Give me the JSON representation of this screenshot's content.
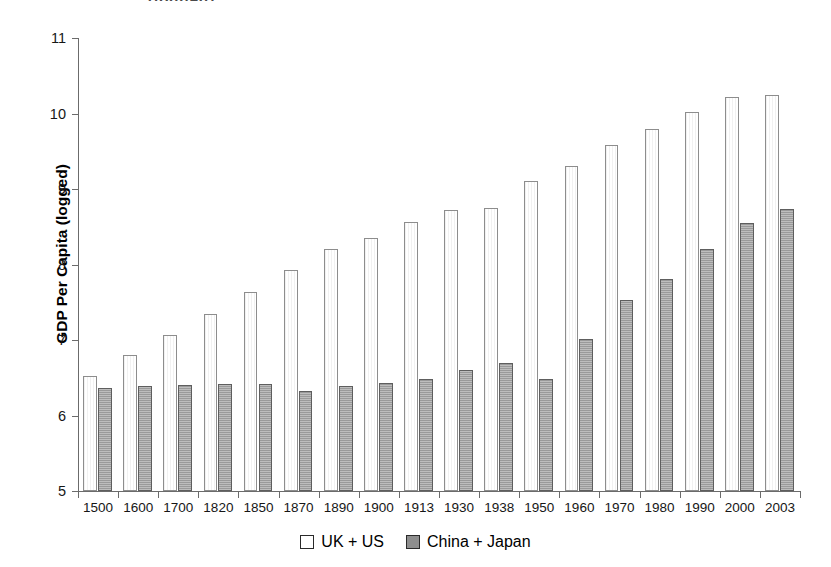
{
  "top_artifact": "(logged)",
  "chart_data": {
    "type": "bar",
    "title": "",
    "xlabel": "",
    "ylabel": "GDP Per Capita (logged)",
    "ylim": [
      5,
      11
    ],
    "yticks": [
      5,
      6,
      7,
      8,
      9,
      10,
      11
    ],
    "grid": false,
    "legend_position": "bottom-center",
    "categories": [
      "1500",
      "1600",
      "1700",
      "1820",
      "1850",
      "1870",
      "1890",
      "1900",
      "1913",
      "1930",
      "1938",
      "1950",
      "1960",
      "1970",
      "1980",
      "1990",
      "2000",
      "2003"
    ],
    "series": [
      {
        "name": "UK + US",
        "style": "light",
        "values": [
          6.52,
          6.8,
          7.06,
          7.35,
          7.63,
          7.93,
          8.2,
          8.35,
          8.56,
          8.72,
          8.75,
          9.11,
          9.3,
          9.58,
          9.8,
          10.02,
          10.22,
          10.25
        ]
      },
      {
        "name": "China + Japan",
        "style": "dark",
        "values": [
          6.37,
          6.39,
          6.4,
          6.42,
          6.42,
          6.32,
          6.39,
          6.43,
          6.48,
          6.6,
          6.7,
          6.48,
          7.02,
          7.53,
          7.81,
          8.21,
          8.55,
          8.73
        ]
      }
    ]
  },
  "legend": {
    "items": [
      {
        "label": "UK + US",
        "style": "light"
      },
      {
        "label": "China + Japan",
        "style": "dark"
      }
    ]
  },
  "colors": {
    "light_bar_fill": "#ffffff",
    "light_bar_border": "#8d8d8d",
    "dark_bar_fill": "#9a9a9a",
    "dark_bar_border": "#5e5e5e",
    "axis": "#6b6b6b",
    "text": "#161616"
  }
}
